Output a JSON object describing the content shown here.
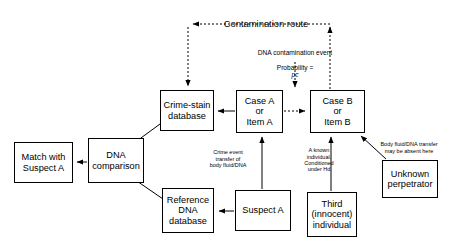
{
  "diagram": {
    "title": "Contamination route",
    "background": "#ffffff",
    "line_color": "#000000",
    "width": 452,
    "height": 243
  },
  "nodes": [
    {
      "id": "match-with-suspect-a",
      "label": "Match with\nSuspect A",
      "x": 14,
      "y": 142,
      "w": 59,
      "h": 41
    },
    {
      "id": "dna-comparison",
      "label": "DNA\ncomparison",
      "x": 88,
      "y": 138,
      "w": 56,
      "h": 45
    },
    {
      "id": "crime-stain-database",
      "label": "Crime-stain\ndatabase",
      "x": 160,
      "y": 90,
      "w": 54,
      "h": 41
    },
    {
      "id": "case-a-or-item-a",
      "label": "Case A\nor\nItem A",
      "x": 236,
      "y": 90,
      "w": 47,
      "h": 43
    },
    {
      "id": "case-b-or-item-b",
      "label": "Case B\nor\nItem B",
      "x": 310,
      "y": 90,
      "w": 55,
      "h": 43
    },
    {
      "id": "reference-dna-database",
      "label": "Reference\nDNA\ndatabase",
      "x": 162,
      "y": 188,
      "w": 52,
      "h": 45
    },
    {
      "id": "suspect-a",
      "label": "Suspect A",
      "x": 235,
      "y": 190,
      "w": 56,
      "h": 41
    },
    {
      "id": "third-innocent-individual",
      "label": "Third\n(innocent)\nindividual",
      "x": 307,
      "y": 192,
      "w": 50,
      "h": 45
    },
    {
      "id": "unknown-perpetrator",
      "label": "Unknown\nperpetrator",
      "x": 382,
      "y": 160,
      "w": 56,
      "h": 38
    }
  ],
  "annotations": [
    {
      "id": "contamination-route-title",
      "text": "Contamination route",
      "x": 211,
      "y": 8,
      "w": 110,
      "size": "title"
    },
    {
      "id": "dna-contamination-event",
      "line1": "DNA contamination event",
      "line2_prefix": "Probability = ",
      "line2_italic": "pc",
      "x": 233,
      "y": 41,
      "w": 124,
      "size": "mid"
    },
    {
      "id": "crime-event-transfer-note",
      "text": "Crime event\ntransfer of\nbody fluid/DNA",
      "x": 197,
      "y": 143,
      "w": 62,
      "size": "small"
    },
    {
      "id": "known-individual-note",
      "text": "A known\nindividual.\nConditioned\nunder Hd",
      "x": 294,
      "y": 141,
      "w": 50,
      "size": "small"
    },
    {
      "id": "body-fluid-absent-note",
      "text": "Body fluid/DNA transfer\nmay be absent here",
      "x": 368,
      "y": 135,
      "w": 82,
      "size": "small"
    }
  ],
  "edges": [
    {
      "id": "case-a-to-crime-stain-database",
      "style": "solid",
      "arrow": "end"
    },
    {
      "id": "case-a-to-case-b-contamination",
      "style": "dashed",
      "arrow": "end"
    },
    {
      "id": "contamination-route-from-case-b",
      "style": "dashed",
      "arrow": "end"
    },
    {
      "id": "contamination-route-to-crime-stain-database",
      "style": "dashed",
      "arrow": "end"
    },
    {
      "id": "dna-contamination-event-to-case-b",
      "style": "dashed",
      "arrow": "end"
    },
    {
      "id": "crime-stain-database-to-dna-comparison",
      "style": "solid",
      "arrow": "end"
    },
    {
      "id": "reference-dna-database-to-dna-comparison",
      "style": "solid",
      "arrow": "end"
    },
    {
      "id": "dna-comparison-to-match",
      "style": "solid",
      "arrow": "end"
    },
    {
      "id": "suspect-a-to-reference-dna-database",
      "style": "solid",
      "arrow": "end"
    },
    {
      "id": "suspect-a-to-case-a",
      "style": "solid",
      "arrow": "end"
    },
    {
      "id": "third-individual-to-case-b",
      "style": "solid",
      "arrow": "end"
    },
    {
      "id": "unknown-perpetrator-to-case-b",
      "style": "solid",
      "arrow": "end"
    }
  ]
}
